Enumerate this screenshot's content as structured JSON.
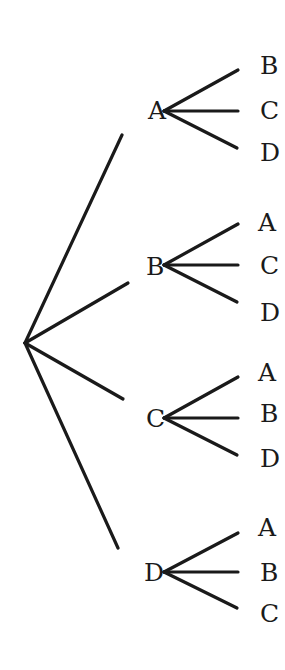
{
  "diagram": {
    "type": "tree",
    "root": {
      "x": 25,
      "y": 343
    },
    "branches": [
      {
        "label": "A",
        "line_end": {
          "x": 122,
          "y": 135
        },
        "label_pos": {
          "x": 148,
          "y": 119
        },
        "node": {
          "x": 164,
          "y": 111
        },
        "children": [
          {
            "label": "B",
            "end": {
              "x": 238,
              "y": 70
            },
            "label_pos": {
              "x": 260,
              "y": 74
            }
          },
          {
            "label": "C",
            "end": {
              "x": 238,
              "y": 111
            },
            "label_pos": {
              "x": 260,
              "y": 119
            }
          },
          {
            "label": "D",
            "end": {
              "x": 237,
              "y": 148
            },
            "label_pos": {
              "x": 260,
              "y": 161
            }
          }
        ]
      },
      {
        "label": "B",
        "line_end": {
          "x": 128,
          "y": 283
        },
        "label_pos": {
          "x": 146,
          "y": 275
        },
        "node": {
          "x": 164,
          "y": 265
        },
        "children": [
          {
            "label": "A",
            "end": {
              "x": 238,
              "y": 224
            },
            "label_pos": {
              "x": 258,
              "y": 231
            }
          },
          {
            "label": "C",
            "end": {
              "x": 238,
              "y": 265
            },
            "label_pos": {
              "x": 260,
              "y": 274
            }
          },
          {
            "label": "D",
            "end": {
              "x": 237,
              "y": 302
            },
            "label_pos": {
              "x": 260,
              "y": 321
            }
          }
        ]
      },
      {
        "label": "C",
        "line_end": {
          "x": 123,
          "y": 399
        },
        "label_pos": {
          "x": 146,
          "y": 427
        },
        "node": {
          "x": 164,
          "y": 418
        },
        "children": [
          {
            "label": "A",
            "end": {
              "x": 238,
              "y": 377
            },
            "label_pos": {
              "x": 258,
              "y": 381
            }
          },
          {
            "label": "B",
            "end": {
              "x": 238,
              "y": 418
            },
            "label_pos": {
              "x": 260,
              "y": 422
            }
          },
          {
            "label": "D",
            "end": {
              "x": 237,
              "y": 455
            },
            "label_pos": {
              "x": 260,
              "y": 467
            }
          }
        ]
      },
      {
        "label": "D",
        "line_end": {
          "x": 118,
          "y": 548
        },
        "label_pos": {
          "x": 144,
          "y": 581
        },
        "node": {
          "x": 164,
          "y": 572
        },
        "children": [
          {
            "label": "A",
            "end": {
              "x": 238,
              "y": 533
            },
            "label_pos": {
              "x": 258,
              "y": 536
            }
          },
          {
            "label": "B",
            "end": {
              "x": 238,
              "y": 572
            },
            "label_pos": {
              "x": 260,
              "y": 581
            }
          },
          {
            "label": "C",
            "end": {
              "x": 237,
              "y": 608
            },
            "label_pos": {
              "x": 260,
              "y": 622
            }
          }
        ]
      }
    ],
    "colors": {
      "line": "#1a1a1a",
      "text": "#1a1a1a",
      "background": "#ffffff"
    }
  }
}
